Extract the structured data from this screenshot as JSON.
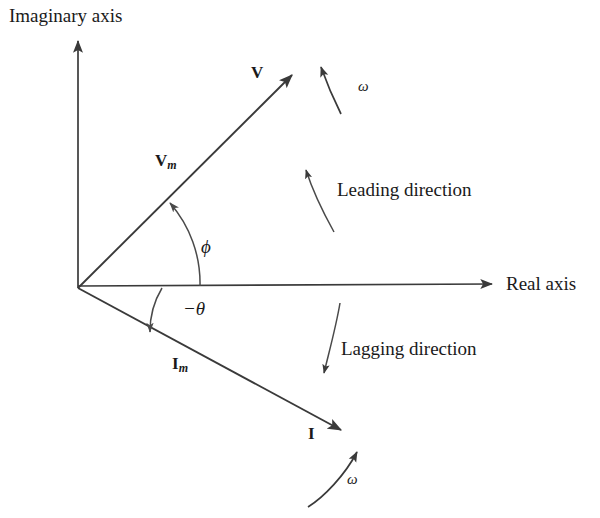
{
  "figure": {
    "type": "phasor-diagram",
    "background_color": "#ffffff",
    "line_color": "#3a3a3a",
    "text_color": "#1a1a1a"
  },
  "axes": {
    "imaginary": {
      "label": "Imaginary axis",
      "direction": "up",
      "origin": {
        "x": 78,
        "y": 288
      },
      "tip": {
        "x": 78,
        "y": 40
      }
    },
    "real": {
      "label": "Real axis",
      "direction": "right",
      "origin": {
        "x": 78,
        "y": 288
      },
      "tip": {
        "x": 494,
        "y": 284
      }
    }
  },
  "phasors": [
    {
      "name": "voltage-phasor",
      "tip_label": "V",
      "magnitude_label": "V",
      "magnitude_subscript": "m",
      "angle_deg": 43,
      "origin": {
        "x": 78,
        "y": 288
      },
      "tip": {
        "x": 294,
        "y": 73
      }
    },
    {
      "name": "current-phasor",
      "tip_label": "I",
      "magnitude_label": "I",
      "magnitude_subscript": "m",
      "angle_deg": -32,
      "origin": {
        "x": 78,
        "y": 288
      },
      "tip": {
        "x": 343,
        "y": 432
      }
    }
  ],
  "angles": [
    {
      "name": "phi-angle",
      "label": "ϕ",
      "from": "real axis",
      "to": "voltage phasor",
      "rotation": "counterclockwise"
    },
    {
      "name": "negative-theta-angle",
      "label": "−θ",
      "from": "real axis",
      "to": "current phasor",
      "rotation": "clockwise"
    }
  ],
  "annotations": [
    {
      "name": "leading-direction",
      "label": "Leading direction"
    },
    {
      "name": "lagging-direction",
      "label": "Lagging direction"
    },
    {
      "name": "omega-top",
      "label": "ω"
    },
    {
      "name": "omega-bottom",
      "label": "ω"
    }
  ]
}
